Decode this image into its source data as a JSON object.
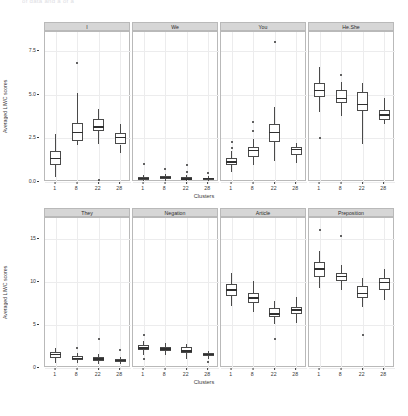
{
  "caption_fragment": "of data and a  of  a",
  "axes": {
    "ylabel": "Averaged LIWC scores",
    "xlabel": "Clusters",
    "xticks": [
      "1",
      "8",
      "22",
      "28"
    ],
    "yticks_top": [
      "0.0",
      "2.5",
      "5.0",
      "7.5"
    ],
    "yticks_bottom": [
      "0",
      "5",
      "10",
      "15"
    ]
  },
  "chart_data": {
    "type": "box",
    "title": "",
    "xlabel": "Clusters",
    "ylabel": "Averaged LIWC scores",
    "categories": [
      1,
      8,
      22,
      28
    ],
    "grid": true,
    "legend": "none",
    "panel_layout": {
      "rows": 2,
      "cols": 4
    },
    "panels": [
      {
        "name": "I",
        "row": 1,
        "ylim": [
          0,
          8.6
        ],
        "yticks": [
          0.0,
          2.5,
          5.0,
          7.5
        ],
        "boxes": [
          {
            "cluster": 1,
            "min": 0.3,
            "q1": 1.0,
            "median": 1.35,
            "q3": 1.75,
            "max": 2.75,
            "outliers": []
          },
          {
            "cluster": 8,
            "min": 2.1,
            "q1": 2.35,
            "median": 2.85,
            "q3": 3.4,
            "max": 5.1,
            "outliers": [
              6.85
            ]
          },
          {
            "cluster": 22,
            "min": 2.2,
            "q1": 2.9,
            "median": 3.15,
            "q3": 3.6,
            "max": 4.2,
            "outliers": [
              0.1
            ]
          },
          {
            "cluster": 28,
            "min": 1.65,
            "q1": 2.15,
            "median": 2.55,
            "q3": 2.8,
            "max": 3.3,
            "outliers": []
          }
        ]
      },
      {
        "name": "We",
        "row": 1,
        "ylim": [
          0,
          8.6
        ],
        "yticks": [
          0.0,
          2.5,
          5.0,
          7.5
        ],
        "boxes": [
          {
            "cluster": 1,
            "min": 0.05,
            "q1": 0.12,
            "median": 0.2,
            "q3": 0.27,
            "max": 0.38,
            "outliers": [
              1.05
            ]
          },
          {
            "cluster": 8,
            "min": 0.08,
            "q1": 0.18,
            "median": 0.26,
            "q3": 0.34,
            "max": 0.48,
            "outliers": [
              0.72
            ]
          },
          {
            "cluster": 22,
            "min": 0.05,
            "q1": 0.12,
            "median": 0.18,
            "q3": 0.26,
            "max": 0.4,
            "outliers": [
              0.95,
              0.6
            ]
          },
          {
            "cluster": 28,
            "min": 0.06,
            "q1": 0.13,
            "median": 0.19,
            "q3": 0.25,
            "max": 0.35,
            "outliers": [
              0.52
            ]
          }
        ]
      },
      {
        "name": "You",
        "row": 1,
        "ylim": [
          0,
          8.6
        ],
        "yticks": [
          0.0,
          2.5,
          5.0,
          7.5
        ],
        "boxes": [
          {
            "cluster": 1,
            "min": 0.55,
            "q1": 0.95,
            "median": 1.15,
            "q3": 1.35,
            "max": 1.75,
            "outliers": [
              2.3,
              1.95
            ]
          },
          {
            "cluster": 8,
            "min": 1.0,
            "q1": 1.45,
            "median": 1.8,
            "q3": 2.0,
            "max": 2.45,
            "outliers": [
              3.45,
              2.9
            ]
          },
          {
            "cluster": 22,
            "min": 1.2,
            "q1": 2.3,
            "median": 2.85,
            "q3": 3.3,
            "max": 4.3,
            "outliers": [
              8.05
            ]
          },
          {
            "cluster": 28,
            "min": 1.1,
            "q1": 1.55,
            "median": 1.85,
            "q3": 2.0,
            "max": 2.25,
            "outliers": []
          }
        ]
      },
      {
        "name": "He.She",
        "row": 1,
        "ylim": [
          0,
          8.6
        ],
        "yticks": [
          0.0,
          2.5,
          5.0,
          7.5
        ],
        "boxes": [
          {
            "cluster": 1,
            "min": 4.0,
            "q1": 4.85,
            "median": 5.25,
            "q3": 5.7,
            "max": 6.6,
            "outliers": [
              2.55
            ]
          },
          {
            "cluster": 8,
            "min": 3.8,
            "q1": 4.55,
            "median": 4.8,
            "q3": 5.25,
            "max": 5.75,
            "outliers": [
              6.15
            ]
          },
          {
            "cluster": 22,
            "min": 2.2,
            "q1": 4.05,
            "median": 4.45,
            "q3": 5.15,
            "max": 5.7,
            "outliers": []
          },
          {
            "cluster": 28,
            "min": 3.35,
            "q1": 3.55,
            "median": 3.85,
            "q3": 4.15,
            "max": 4.8,
            "outliers": []
          }
        ]
      },
      {
        "name": "They",
        "row": 2,
        "ylim": [
          0,
          17.5
        ],
        "yticks": [
          0,
          5,
          10,
          15
        ],
        "boxes": [
          {
            "cluster": 1,
            "min": 0.55,
            "q1": 1.2,
            "median": 1.55,
            "q3": 1.85,
            "max": 2.35,
            "outliers": []
          },
          {
            "cluster": 8,
            "min": 0.6,
            "q1": 0.9,
            "median": 1.1,
            "q3": 1.35,
            "max": 1.7,
            "outliers": [
              2.3
            ]
          },
          {
            "cluster": 22,
            "min": 0.45,
            "q1": 0.85,
            "median": 1.05,
            "q3": 1.3,
            "max": 1.6,
            "outliers": [
              3.4
            ]
          },
          {
            "cluster": 28,
            "min": 0.45,
            "q1": 0.7,
            "median": 0.85,
            "q3": 1.0,
            "max": 1.25,
            "outliers": [
              2.05
            ]
          }
        ]
      },
      {
        "name": "Negation",
        "row": 2,
        "ylim": [
          0,
          17.5
        ],
        "yticks": [
          0,
          5,
          10,
          15
        ],
        "boxes": [
          {
            "cluster": 1,
            "min": 1.5,
            "q1": 2.05,
            "median": 2.35,
            "q3": 2.65,
            "max": 3.1,
            "outliers": [
              3.8,
              1.05
            ]
          },
          {
            "cluster": 8,
            "min": 1.55,
            "q1": 1.95,
            "median": 2.2,
            "q3": 2.45,
            "max": 2.9,
            "outliers": []
          },
          {
            "cluster": 22,
            "min": 1.1,
            "q1": 1.75,
            "median": 2.0,
            "q3": 2.4,
            "max": 2.8,
            "outliers": []
          },
          {
            "cluster": 28,
            "min": 1.05,
            "q1": 1.35,
            "median": 1.55,
            "q3": 1.75,
            "max": 2.0,
            "outliers": [
              0.75
            ]
          }
        ]
      },
      {
        "name": "Article",
        "row": 2,
        "ylim": [
          0,
          17.5
        ],
        "yticks": [
          0,
          5,
          10,
          15
        ],
        "boxes": [
          {
            "cluster": 1,
            "min": 7.2,
            "q1": 8.35,
            "median": 9.1,
            "q3": 9.85,
            "max": 11.1,
            "outliers": []
          },
          {
            "cluster": 8,
            "min": 6.5,
            "q1": 7.55,
            "median": 8.15,
            "q3": 8.8,
            "max": 10.1,
            "outliers": []
          },
          {
            "cluster": 22,
            "min": 5.1,
            "q1": 5.95,
            "median": 6.3,
            "q3": 7.0,
            "max": 7.8,
            "outliers": [
              3.4
            ]
          },
          {
            "cluster": 28,
            "min": 5.3,
            "q1": 6.3,
            "median": 6.75,
            "q3": 7.15,
            "max": 8.3,
            "outliers": []
          }
        ]
      },
      {
        "name": "Preposition",
        "row": 2,
        "ylim": [
          0,
          17.5
        ],
        "yticks": [
          0,
          5,
          10,
          15
        ],
        "boxes": [
          {
            "cluster": 1,
            "min": 9.3,
            "q1": 10.65,
            "median": 11.55,
            "q3": 12.35,
            "max": 13.6,
            "outliers": [
              16.1
            ]
          },
          {
            "cluster": 8,
            "min": 9.1,
            "q1": 10.15,
            "median": 10.7,
            "q3": 11.1,
            "max": 12.05,
            "outliers": [
              15.4
            ]
          },
          {
            "cluster": 22,
            "min": 7.1,
            "q1": 8.15,
            "median": 8.7,
            "q3": 9.55,
            "max": 10.55,
            "outliers": [
              3.8
            ]
          },
          {
            "cluster": 28,
            "min": 7.9,
            "q1": 9.05,
            "median": 9.95,
            "q3": 10.55,
            "max": 11.55,
            "outliers": []
          }
        ]
      }
    ]
  }
}
